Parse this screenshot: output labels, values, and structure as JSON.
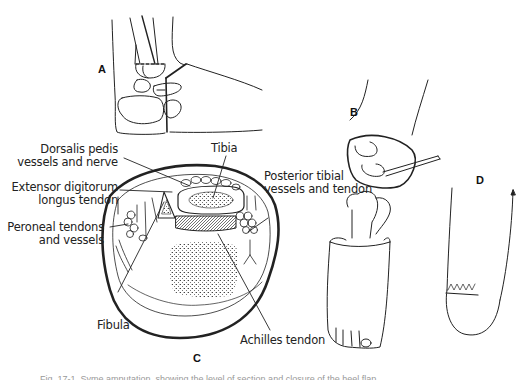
{
  "figure": {
    "panels": {
      "a": "A",
      "b": "B",
      "c": "C",
      "d": "D"
    },
    "labels": {
      "dorsalis_line1": "Dorsalis pedis",
      "dorsalis_line2": "vessels and nerve",
      "tibia": "Tibia",
      "extensor_line1": "Extensor digitorum",
      "extensor_line2": "longus tendon",
      "posterior_line1": "Posterior tibial",
      "posterior_line2": "vessels and tendon",
      "peroneal_line1": "Peroneal tendons",
      "peroneal_line2": "and vessels",
      "fibula": "Fibula",
      "achilles": "Achilles tendon"
    },
    "caption": "Fig. 17-1. Syme amputation, showing the level of section and closure of the heel flap."
  }
}
